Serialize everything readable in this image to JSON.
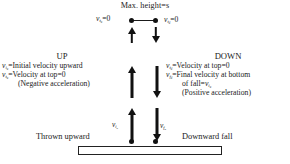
{
  "diagram": {
    "apex": {
      "max_height_label": "Max. height=s",
      "left_velocity": {
        "symbol": "v",
        "sub_main": "t",
        "sub_sec": "u",
        "equals": "=0"
      },
      "right_velocity": {
        "symbol": "v",
        "sub_main": "t",
        "sub_sec": "d",
        "equals": "=0"
      },
      "dot_left_name": "apex-dot-left",
      "dot_right_name": "apex-dot-right"
    },
    "up_section": {
      "heading": "UP",
      "lines": [
        {
          "symbol": "v",
          "sub_main": "i",
          "sub_sec": "u",
          "text": "=Initial velocity upward",
          "indent": false
        },
        {
          "symbol": "v",
          "sub_main": "t",
          "sub_sec": "u",
          "text": "=Velocity at top=0",
          "indent": false
        },
        {
          "symbol": "",
          "sub_main": "",
          "sub_sec": "",
          "text": "(Negative acceleration)",
          "indent": true
        }
      ]
    },
    "down_section": {
      "heading": "DOWN",
      "lines": [
        {
          "symbol": "v",
          "sub_main": "t",
          "sub_sec": "d",
          "text": "=Velocity at top=0",
          "indent": false
        },
        {
          "symbol": "v",
          "sub_main": "f",
          "sub_sec": "d",
          "text": "=Final velocity at bottom",
          "indent": false
        },
        {
          "symbol": "",
          "sub_main": "",
          "sub_sec": "",
          "text": "of fall=",
          "indent": true,
          "trail_symbol": "v",
          "trail_sub_main": "i",
          "trail_sub_sec": "u"
        },
        {
          "symbol": "",
          "sub_main": "",
          "sub_sec": "",
          "text": "(Positive acceleration)",
          "indent": true
        }
      ]
    },
    "bottom": {
      "left_velocity": {
        "symbol": "v",
        "sub_main": "i",
        "sub_sec": "u"
      },
      "right_velocity": {
        "symbol": "v",
        "sub_main": "f",
        "sub_sec": "d"
      },
      "left_caption": "Thrown upward",
      "right_caption": "Downward fall"
    },
    "colors": {
      "ink": "#1a1a1a",
      "marker": "#111111",
      "background": "#ffffff"
    }
  }
}
